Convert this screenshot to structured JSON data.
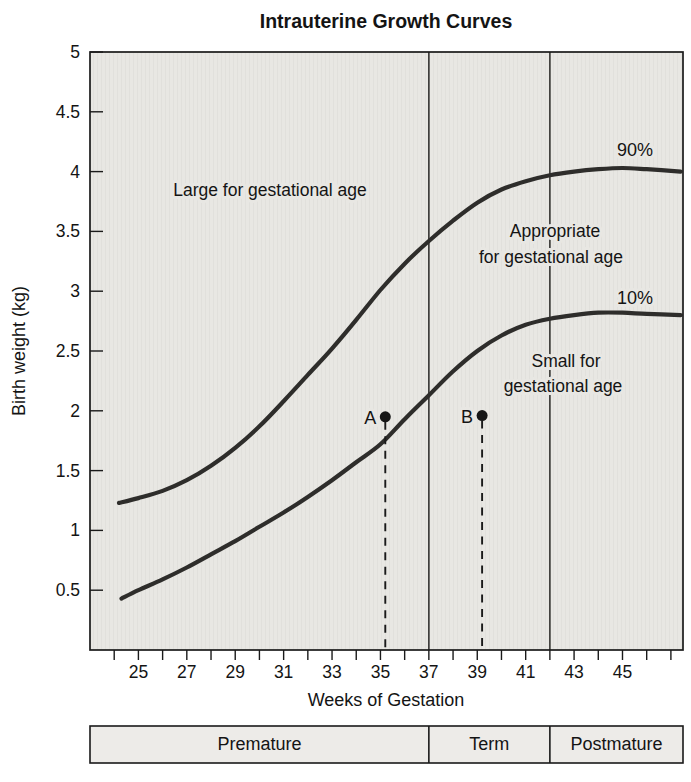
{
  "figure": {
    "title": "Intrauterine Growth Curves"
  },
  "colors": {
    "plot_bg": "#e8e7e3",
    "bar_bg": "#edebe8",
    "curve": "#2e2d2b",
    "line": "#3f3e3c",
    "ink": "#141414"
  },
  "chart_data": {
    "type": "line",
    "title": "Intrauterine Growth Curves",
    "xlabel": "Weeks of Gestation",
    "ylabel": "Birth weight (kg)",
    "xlim": [
      23,
      47.5
    ],
    "ylim": [
      0,
      5
    ],
    "grid": false,
    "x_minor_tick_step": 1,
    "x_tick_labels": [
      25,
      27,
      29,
      31,
      33,
      35,
      37,
      39,
      41,
      43,
      45
    ],
    "y_tick_labels": [
      5,
      4.5,
      4,
      3.5,
      3,
      2.5,
      2,
      1.5,
      1,
      0.5
    ],
    "series": [
      {
        "name": "90%",
        "x": [
          24.2,
          25,
          26,
          27,
          28,
          29,
          30,
          31,
          32,
          33,
          34,
          35,
          36,
          37,
          38,
          39,
          40,
          41,
          42,
          43,
          44,
          45,
          46,
          47.4
        ],
        "y": [
          1.23,
          1.27,
          1.33,
          1.42,
          1.54,
          1.69,
          1.87,
          2.08,
          2.3,
          2.52,
          2.76,
          3.01,
          3.23,
          3.42,
          3.59,
          3.74,
          3.85,
          3.92,
          3.97,
          4.0,
          4.02,
          4.03,
          4.02,
          4.0
        ]
      },
      {
        "name": "10%",
        "x": [
          24.3,
          25,
          26,
          27,
          28,
          29,
          30,
          31,
          32,
          33,
          34,
          35,
          36,
          37,
          38,
          39,
          40,
          41,
          42,
          43,
          44,
          45,
          46,
          47.4
        ],
        "y": [
          0.43,
          0.5,
          0.59,
          0.69,
          0.8,
          0.91,
          1.03,
          1.15,
          1.28,
          1.42,
          1.57,
          1.72,
          1.93,
          2.13,
          2.33,
          2.5,
          2.63,
          2.72,
          2.77,
          2.8,
          2.82,
          2.82,
          2.81,
          2.8
        ]
      }
    ],
    "series_labels": {
      "p90": "90%",
      "p10": "10%"
    },
    "reference_lines_weeks": [
      37,
      42
    ],
    "marked_points": [
      {
        "label": "A",
        "week": 35.2,
        "weight": 1.95
      },
      {
        "label": "B",
        "week": 39.2,
        "weight": 1.96
      }
    ],
    "region_labels": {
      "large": "Large for gestational age",
      "appropriate": [
        "Appropriate",
        "for gestational age"
      ],
      "small": [
        "Small for",
        "gestational age"
      ]
    },
    "maturity_zones": [
      {
        "label": "Premature",
        "from": 23,
        "to": 37
      },
      {
        "label": "Term",
        "from": 37,
        "to": 42
      },
      {
        "label": "Postmature",
        "from": 42,
        "to": 47.5
      }
    ]
  }
}
